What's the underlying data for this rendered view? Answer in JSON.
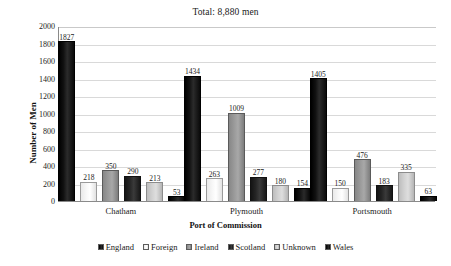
{
  "chart_data": {
    "type": "bar",
    "title": "Total: 8,880 men",
    "xlabel": "Port of Commission",
    "ylabel": "Number of Men",
    "ylim": [
      0,
      2000
    ],
    "ytick_step": 200,
    "yticks": [
      "2000",
      "1800",
      "1600",
      "1400",
      "1200",
      "1000",
      "800",
      "600",
      "400",
      "200",
      "0"
    ],
    "grid": true,
    "legend_position": "bottom",
    "categories": [
      "Chatham",
      "Plymouth",
      "Portsmouth"
    ],
    "series": [
      {
        "name": "England",
        "color": "#000000",
        "values": [
          1827,
          1434,
          1405
        ]
      },
      {
        "name": "Foreign",
        "color": "#f2f2f2",
        "values": [
          218,
          263,
          150
        ]
      },
      {
        "name": "Ireland",
        "color": "#9a9a9a",
        "values": [
          350,
          1009,
          476
        ]
      },
      {
        "name": "Scotland",
        "color": "#242424",
        "values": [
          290,
          277,
          183
        ]
      },
      {
        "name": "Unknown",
        "color": "#d2d2d2",
        "values": [
          213,
          180,
          335
        ]
      },
      {
        "name": "Wales",
        "color": "#0d0d0d",
        "values": [
          53,
          154,
          63
        ]
      }
    ]
  }
}
